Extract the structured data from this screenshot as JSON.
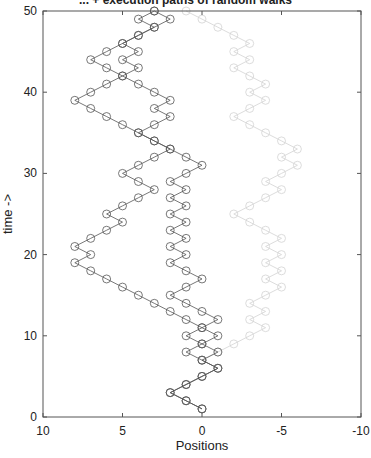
{
  "chart_data": {
    "type": "line",
    "title": "... + execution paths of random walks",
    "xlabel": "Positions",
    "ylabel": "time ->",
    "xlim": [
      10,
      -10
    ],
    "ylim": [
      0,
      50
    ],
    "xticks": [
      10,
      5,
      0,
      -5,
      -10
    ],
    "yticks": [
      0,
      10,
      20,
      30,
      40,
      50
    ],
    "grid": false,
    "legend": null,
    "marker": "open-circle",
    "t": [
      1,
      2,
      3,
      4,
      5,
      6,
      7,
      8,
      9,
      10,
      11,
      12,
      13,
      14,
      15,
      16,
      17,
      18,
      19,
      20,
      21,
      22,
      23,
      24,
      25,
      26,
      27,
      28,
      29,
      30,
      31,
      32,
      33,
      34,
      35,
      36,
      37,
      38,
      39,
      40,
      41,
      42,
      43,
      44,
      45,
      46,
      47,
      48,
      49,
      50
    ],
    "series": [
      {
        "name": "walk-left",
        "color": "#555555",
        "opacity": 1,
        "positions": [
          0,
          1,
          2,
          1,
          0,
          -1,
          0,
          1,
          0,
          1,
          0,
          1,
          2,
          3,
          4,
          5,
          6,
          7,
          8,
          7,
          8,
          7,
          6,
          5,
          6,
          5,
          4,
          3,
          4,
          5,
          4,
          3,
          2,
          3,
          4,
          5,
          6,
          7,
          8,
          7,
          6,
          5,
          6,
          7,
          6,
          5,
          4,
          3,
          2,
          3
        ]
      },
      {
        "name": "walk-middle",
        "color": "#555555",
        "opacity": 1,
        "positions": [
          0,
          1,
          2,
          1,
          0,
          -1,
          0,
          -1,
          0,
          -1,
          0,
          -1,
          0,
          1,
          2,
          1,
          0,
          1,
          2,
          1,
          2,
          1,
          2,
          1,
          2,
          1,
          2,
          1,
          2,
          1,
          0,
          1,
          2,
          3,
          4,
          3,
          2,
          3,
          2,
          3,
          4,
          5,
          4,
          5,
          4,
          5,
          4,
          3,
          4,
          3
        ]
      },
      {
        "name": "walk-right-faded",
        "color": "#555555",
        "opacity": 0.25,
        "positions": [
          0,
          1,
          2,
          1,
          0,
          -1,
          0,
          -1,
          -2,
          -3,
          -4,
          -3,
          -4,
          -3,
          -4,
          -5,
          -4,
          -5,
          -4,
          -5,
          -4,
          -5,
          -4,
          -3,
          -2,
          -3,
          -4,
          -5,
          -4,
          -5,
          -6,
          -5,
          -6,
          -5,
          -4,
          -3,
          -2,
          -3,
          -4,
          -3,
          -4,
          -3,
          -2,
          -3,
          -2,
          -3,
          -2,
          -1,
          0,
          1
        ]
      }
    ]
  }
}
